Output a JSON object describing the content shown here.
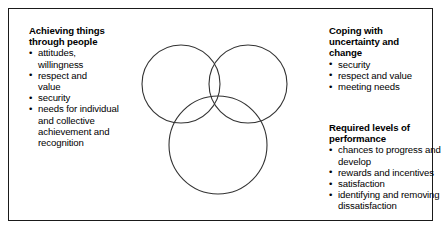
{
  "figure": {
    "type": "venn-diagram",
    "title": "",
    "border_color": "#1a1a1a",
    "background": "#ffffff",
    "circle_stroke": "#333333"
  },
  "diagram": {
    "circles": [
      {
        "name": "top-left-circle",
        "cx": 52,
        "cy": 57,
        "r": 39
      },
      {
        "name": "top-right-circle",
        "cx": 119,
        "cy": 57,
        "r": 39
      },
      {
        "name": "bottom-circle",
        "cx": 89,
        "cy": 118,
        "r": 49
      }
    ]
  },
  "blocks": {
    "achieving": {
      "heading": "Achieving things\nthrough people",
      "items": [
        "attitudes,\nwillingness",
        "respect and\nvalue",
        "security",
        "needs for individual\nand collective\nachievement and\nrecognition"
      ]
    },
    "coping": {
      "heading": "Coping with\nuncertainty and\nchange",
      "items": [
        "security",
        "respect and value",
        "meeting needs"
      ]
    },
    "required": {
      "heading": "Required levels of\nperformance",
      "items": [
        "chances to progress and\ndevelop",
        "rewards and incentives",
        "satisfaction",
        "identifying and removing\ndissatisfaction"
      ]
    }
  },
  "bullet_glyph": "•"
}
